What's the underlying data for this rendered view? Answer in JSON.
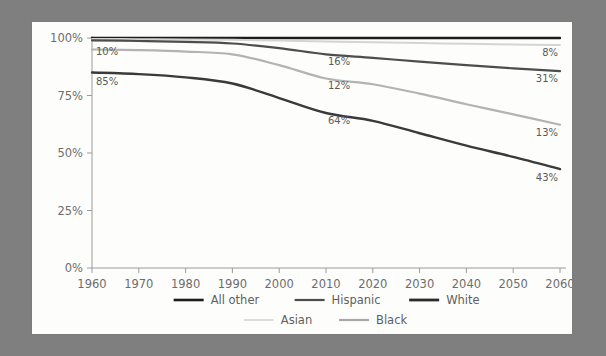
{
  "chart_data": {
    "type": "line",
    "title": "",
    "subtitle": "",
    "xlabel": "",
    "ylabel": "",
    "x": [
      1960,
      1970,
      1980,
      1990,
      2000,
      2010,
      2020,
      2030,
      2040,
      2050,
      2060
    ],
    "xticklabels": [
      "1960",
      "1970",
      "1980",
      "1990",
      "2000",
      "2010",
      "2020",
      "2030",
      "2040",
      "2050",
      "2060"
    ],
    "yticklabels": [
      "0%",
      "25%",
      "50%",
      "75%",
      "100%"
    ],
    "yticks": [
      0,
      25,
      50,
      75,
      100
    ],
    "ylim": [
      0,
      100
    ],
    "xlim": [
      1960,
      2060
    ],
    "grid": false,
    "legend_position": "bottom",
    "series": [
      {
        "name": "All other",
        "color": "#1c1c1c",
        "width": 2.4,
        "values": [
          100,
          100,
          100,
          100,
          100,
          100,
          100,
          100,
          100,
          100,
          100
        ]
      },
      {
        "name": "Asian",
        "color": "#d4d4d4",
        "width": 2.0,
        "values": [
          99.6,
          99.5,
          99.4,
          99.2,
          98.9,
          98.5,
          98.1,
          97.8,
          97.5,
          97.2,
          97.0
        ]
      },
      {
        "name": "Hispanic",
        "color": "#4d4d4d",
        "width": 2.2,
        "values": [
          99.0,
          98.7,
          98.3,
          97.6,
          95.6,
          92.9,
          91.4,
          89.7,
          88.2,
          86.8,
          85.6
        ]
      },
      {
        "name": "Black",
        "color": "#b3b3b3",
        "width": 2.2,
        "values": [
          95.0,
          94.7,
          94.1,
          92.9,
          88.2,
          82.4,
          79.9,
          75.8,
          71.2,
          66.8,
          62.3
        ]
      },
      {
        "name": "White",
        "color": "#3a3a3a",
        "width": 2.4,
        "values": [
          85.0,
          84.3,
          82.9,
          80.2,
          73.9,
          67.4,
          64.0,
          58.6,
          53.2,
          48.3,
          43.0
        ]
      }
    ],
    "annotations": [
      {
        "text": "10%",
        "x": 1960,
        "y": 97.5,
        "anchor": "start",
        "dx": 4,
        "dy": 11
      },
      {
        "text": "85%",
        "x": 1960,
        "y": 85.0,
        "anchor": "start",
        "dx": 4,
        "dy": 12
      },
      {
        "text": "16%",
        "x": 2010,
        "y": 92.9,
        "anchor": "start",
        "dx": 2,
        "dy": 11
      },
      {
        "text": "12%",
        "x": 2010,
        "y": 82.4,
        "anchor": "start",
        "dx": 2,
        "dy": 11
      },
      {
        "text": "64%",
        "x": 2010,
        "y": 67.4,
        "anchor": "start",
        "dx": 2,
        "dy": 11
      },
      {
        "text": "8%",
        "x": 2060,
        "y": 97.0,
        "anchor": "end",
        "dx": -2,
        "dy": 11
      },
      {
        "text": "31%",
        "x": 2060,
        "y": 85.6,
        "anchor": "end",
        "dx": -2,
        "dy": 11
      },
      {
        "text": "13%",
        "x": 2060,
        "y": 62.3,
        "anchor": "end",
        "dx": -2,
        "dy": 11
      },
      {
        "text": "43%",
        "x": 2060,
        "y": 43.0,
        "anchor": "end",
        "dx": -2,
        "dy": 12
      }
    ],
    "legend": [
      {
        "label": "All other",
        "color": "#1c1c1c",
        "width": 2.6,
        "row": 0
      },
      {
        "label": "Hispanic",
        "color": "#4d4d4d",
        "width": 2.2,
        "row": 0
      },
      {
        "label": "White",
        "color": "#2b2b2b",
        "width": 2.8,
        "row": 0
      },
      {
        "label": "Asian",
        "color": "#dcdcdc",
        "width": 2.0,
        "row": 1
      },
      {
        "label": "Black",
        "color": "#a8a8a8",
        "width": 2.2,
        "row": 1
      }
    ]
  },
  "theme": {
    "page_background": "#7f7f7f",
    "card_background": "#fdfdfb",
    "axis_color": "#9a9a9a",
    "tick_text_color": "#6d6d6d",
    "label_text_color": "#5a5a5a"
  }
}
